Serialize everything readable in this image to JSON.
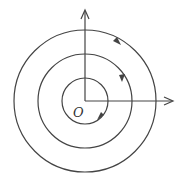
{
  "diagram": {
    "type": "phase-portrait-concentric-orbits",
    "origin_label": "O",
    "center": [
      85,
      101
    ],
    "orbits": [
      {
        "radius": 23,
        "direction": "counterclockwise"
      },
      {
        "radius": 47,
        "direction": "counterclockwise"
      },
      {
        "radius": 71,
        "direction": "counterclockwise"
      }
    ],
    "axes": {
      "x_arrow": true,
      "y_arrow": true
    },
    "colors": {
      "stroke": "#444444",
      "background": "#ffffff"
    }
  }
}
